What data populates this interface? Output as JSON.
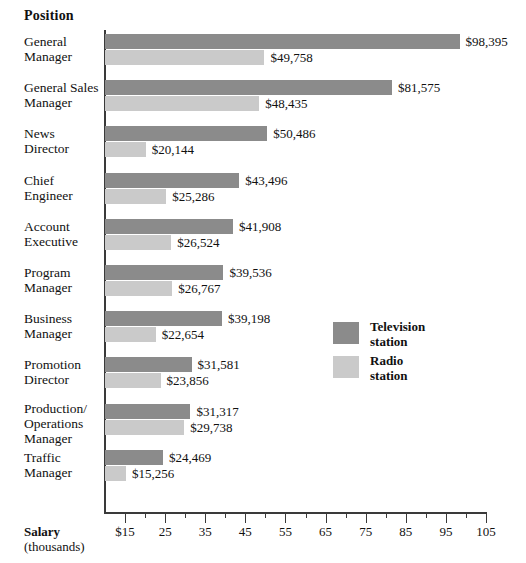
{
  "header": {
    "position_label": "Position",
    "salary_label_bold": "Salary",
    "salary_label_sub": "(thousands)"
  },
  "legend": {
    "items": [
      {
        "name": "television-station",
        "line1": "Television",
        "line2": "station",
        "color": "#8b8b8b"
      },
      {
        "name": "radio-station",
        "line1": "Radio",
        "line2": "station",
        "color": "#cacaca"
      }
    ]
  },
  "axis": {
    "tick_labels": [
      "$15",
      "25",
      "35",
      "45",
      "55",
      "65",
      "75",
      "85",
      "95",
      "105"
    ],
    "tick_values": [
      15,
      25,
      35,
      45,
      55,
      65,
      75,
      85,
      95,
      105
    ],
    "minor_tick_values": [
      20,
      30,
      40,
      50,
      60,
      70,
      80,
      90,
      100
    ],
    "min": 10,
    "max": 105
  },
  "chart_data": {
    "type": "bar",
    "orientation": "horizontal",
    "title": "",
    "xlabel": "Salary (thousands)",
    "ylabel": "Position",
    "xlim": [
      10,
      105
    ],
    "grid": false,
    "legend_position": "inside-right",
    "categories": [
      "General Manager",
      "General Sales Manager",
      "News Director",
      "Chief Engineer",
      "Account Executive",
      "Program Manager",
      "Business Manager",
      "Promotion Director",
      "Production/ Operations Manager",
      "Traffic Manager"
    ],
    "category_lines": [
      [
        "General",
        "Manager"
      ],
      [
        "General Sales",
        "Manager"
      ],
      [
        "News",
        "Director"
      ],
      [
        "Chief",
        "Engineer"
      ],
      [
        "Account",
        "Executive"
      ],
      [
        "Program",
        "Manager"
      ],
      [
        "Business",
        "Manager"
      ],
      [
        "Promotion",
        "Director"
      ],
      [
        "Production/",
        "Operations",
        "Manager"
      ],
      [
        "Traffic",
        "Manager"
      ]
    ],
    "series": [
      {
        "name": "Television station",
        "color": "#8b8b8b",
        "values": [
          98395,
          81575,
          50486,
          43496,
          41908,
          39536,
          39198,
          31581,
          31317,
          24469
        ],
        "labels": [
          "$98,395",
          "$81,575",
          "$50,486",
          "$43,496",
          "$41,908",
          "$39,536",
          "$39,198",
          "$31,581",
          "$31,317",
          "$24,469"
        ]
      },
      {
        "name": "Radio station",
        "color": "#cacaca",
        "values": [
          49758,
          48435,
          20144,
          25286,
          26524,
          26767,
          22654,
          23856,
          29738,
          15256
        ],
        "labels": [
          "$49,758",
          "$48,435",
          "$20,144",
          "$25,286",
          "$26,524",
          "$26,767",
          "$22,654",
          "$23,856",
          "$29,738",
          "$15,256"
        ]
      }
    ]
  }
}
